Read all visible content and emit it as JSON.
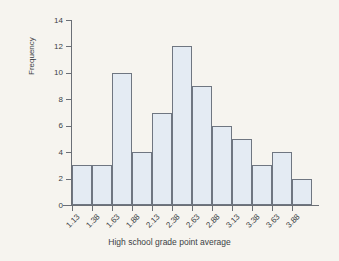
{
  "chart_data": {
    "type": "bar",
    "title": "",
    "subtitle": "",
    "xlabel": "High school grade point average",
    "ylabel": "Frequency",
    "categories": [
      "1.13",
      "1.38",
      "1.63",
      "1.88",
      "2.13",
      "2.38",
      "2.63",
      "2.88",
      "3.13",
      "3.38",
      "3.63",
      "3.88"
    ],
    "values": [
      3,
      3,
      10,
      4,
      7,
      12,
      9,
      6,
      5,
      3,
      4,
      2
    ],
    "ylim": [
      0,
      14
    ],
    "y_ticks": [
      "0",
      "2",
      "4",
      "6",
      "8",
      "10",
      "12",
      "14"
    ],
    "y_tick_values": [
      0,
      2,
      4,
      6,
      8,
      10,
      12,
      14
    ],
    "grid": false,
    "legend": "none",
    "bar_fill_color": "#e4ebf3",
    "bar_edge_color": "#6f7681",
    "axis_color": "#6b6f76",
    "background_color": "#f6f4ef",
    "x_tick_label_rotation": -45,
    "bin_width": 0.25,
    "n_bins": 12,
    "total_frequency": 68
  }
}
